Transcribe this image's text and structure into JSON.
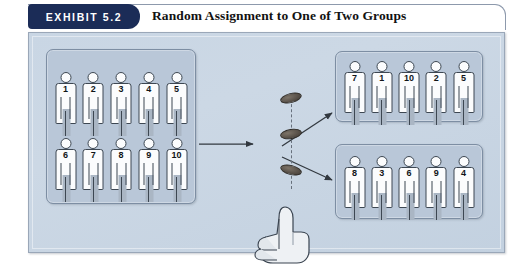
{
  "header": {
    "badge_label": "EXHIBIT 5.2",
    "title": "Random Assignment to One of Two Groups",
    "badge_color": "#1b2c57",
    "title_color": "#121212"
  },
  "panel": {
    "background_color": "#c9d6e4",
    "border_color": "#9aa7b8"
  },
  "groups": {
    "pool": {
      "name": "participant-pool",
      "rows": [
        [
          "1",
          "2",
          "3",
          "4",
          "5"
        ],
        [
          "6",
          "7",
          "8",
          "9",
          "10"
        ]
      ]
    },
    "group_a": {
      "name": "assigned-group-top",
      "rows": [
        [
          "7",
          "1",
          "10",
          "2",
          "5"
        ]
      ]
    },
    "group_b": {
      "name": "assigned-group-bottom",
      "rows": [
        [
          "8",
          "3",
          "6",
          "9",
          "4"
        ]
      ]
    }
  },
  "randomizer": {
    "name": "coin-flip",
    "coin_count": 3,
    "coin_color": "#5a524a",
    "hand_label": "thumbs-up-hand",
    "trajectory_style": "dashed"
  },
  "arrows": {
    "pool_to_randomizer": "horizontal-right",
    "randomizer_to_group_a": "diagonal-up-right",
    "randomizer_to_group_b": "diagonal-down-right",
    "color": "#32383f"
  },
  "figure": {
    "body_fill": "#fbfcfd",
    "outline_color": "#3d4752",
    "group_box_fill": "#b9c7d8"
  }
}
